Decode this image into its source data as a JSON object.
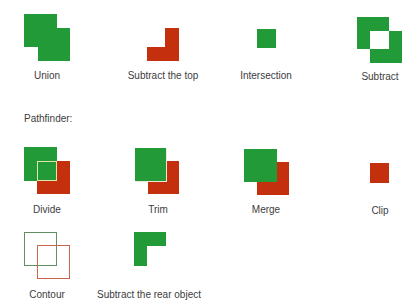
{
  "colors": {
    "green": "#239a38",
    "red": "#c4300e",
    "divide_outline": "#dfe6a8",
    "contour_green": "#5f8f62",
    "contour_red": "#c8664e"
  },
  "shape_modes": {
    "items": [
      {
        "label": "Union"
      },
      {
        "label": "Subtract the top"
      },
      {
        "label": "Intersection"
      },
      {
        "label": "Subtract"
      }
    ]
  },
  "pathfinder": {
    "heading": "Pathfinder:",
    "items": [
      {
        "label": "Divide"
      },
      {
        "label": "Trim"
      },
      {
        "label": "Merge"
      },
      {
        "label": "Clip"
      },
      {
        "label": "Contour"
      },
      {
        "label": "Subtract the rear object"
      }
    ]
  }
}
